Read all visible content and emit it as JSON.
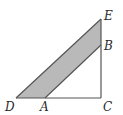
{
  "diagram": {
    "points": {
      "D": {
        "label": "D",
        "x": 16,
        "y": 98
      },
      "A": {
        "label": "A",
        "x": 45,
        "y": 98
      },
      "C": {
        "label": "C",
        "x": 101,
        "y": 98
      },
      "B": {
        "label": "B",
        "x": 101,
        "y": 45
      },
      "E": {
        "label": "E",
        "x": 101,
        "y": 19
      }
    },
    "shaded_region": [
      "D",
      "A",
      "B",
      "E"
    ],
    "colors": {
      "shade": "#b9b9b9",
      "stroke": "#555555",
      "label": "#2a2a2a"
    }
  }
}
